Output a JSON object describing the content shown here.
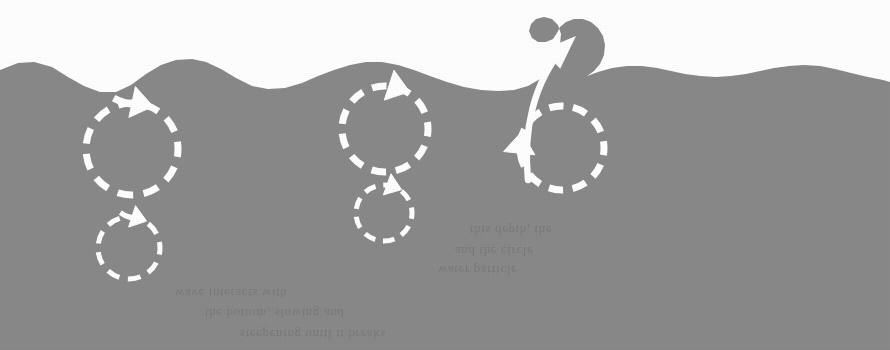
{
  "figure": {
    "title": "Wave orbital motion and breaking wave over a sloping shore"
  },
  "colors": {
    "page_background": "#ffffff",
    "water_fill": "#898989",
    "seabed_fill": "#d7d7d7",
    "annotation_stroke": "#ffffff",
    "bleed_text": "#b9b9b9"
  },
  "water": {
    "name": "water-body",
    "surface_points": "0,70 18,63 34,62 52,67 68,77 84,86 100,92 116,92 131,85 146,74 161,65 176,60 192,59 206,62 221,69 236,78 252,86 268,89 285,88 302,83 318,76 334,70 350,65 366,62 382,62 398,65 414,70 430,76 447,82 464,87 481,90 498,91 514,90 528,86 540,79 549,69 556,57 560,45 561,34 558,25 552,19 544,17 536,19 531,24 529,31 532,38 538,42 546,42 553,39 557,33 560,27 566,22 574,19 583,19 591,22 598,28 603,36 605,45 604,55 600,64 594,71 587,76 598,72 612,68 627,66 642,66 657,68 671,71 685,74 700,76 716,77 731,76 746,74 760,71 774,68 789,66 804,65 820,66 835,69 851,73 868,77 883,80 890,82",
    "crest": {
      "name": "breaking-crest",
      "x": 560,
      "y": 18,
      "label": "breaking wave crest"
    }
  },
  "seabed": {
    "name": "sloping-seabed",
    "profile_points": "0,312 60,300 125,289 195,279 265,269 330,259 400,248 470,236 540,222 610,206 680,190 750,174 820,158 890,144",
    "label": "sloping bottom"
  },
  "orbits": [
    {
      "id": "orbit-deep-large-left",
      "name": "orbit-circle-large-left",
      "cx": 132,
      "cy": 149,
      "r": 46,
      "arrow": {
        "angle_deg": -78,
        "direction": "clockwise",
        "style": "open-barbed"
      },
      "style": "dashed",
      "label": "large orbital path in deep water"
    },
    {
      "id": "orbit-deep-small-left",
      "name": "orbit-circle-small-left",
      "cx": 129,
      "cy": 248,
      "r": 31,
      "arrow": {
        "angle_deg": -72,
        "direction": "clockwise",
        "style": "open-barbed"
      },
      "style": "dashed",
      "label": "smaller orbital path with depth"
    },
    {
      "id": "orbit-mid-large",
      "name": "orbit-circle-large-middle",
      "cx": 385,
      "cy": 129,
      "r": 43,
      "arrow": {
        "angle_deg": -72,
        "direction": "clockwise",
        "style": "solid-triangle"
      },
      "style": "dashed",
      "label": "compressed orbital path in shoaling water"
    },
    {
      "id": "orbit-mid-small",
      "name": "orbit-circle-small-middle",
      "cx": 384,
      "cy": 213,
      "r": 28,
      "arrow": {
        "angle_deg": -70,
        "direction": "clockwise",
        "style": "solid-triangle"
      },
      "style": "dashed",
      "label": "flattened orbital path near bottom"
    },
    {
      "id": "orbit-breaker",
      "name": "orbit-circle-breaker",
      "cx": 562,
      "cy": 148,
      "r": 42,
      "arrow": {
        "angle_deg": 186,
        "direction": "clockwise",
        "style": "solid-triangle"
      },
      "style": "dashed",
      "label": "orbital path beneath the breaker"
    }
  ],
  "crest_arrow": {
    "name": "breaking-crest-arrow",
    "path": "M 528,180 C 523,131 533,82 565,46",
    "head_at": {
      "x": 576,
      "y": 36
    },
    "style": "solid-curved",
    "label": "water carried forward up the breaking crest"
  },
  "bleed_text": {
    "note": "faint show-through text from the reverse side of the printed page",
    "lines": [
      {
        "text": "this depth, the",
        "x": 470,
        "y": 222,
        "size": 13
      },
      {
        "text": "and the circle",
        "x": 455,
        "y": 243,
        "size": 13
      },
      {
        "text": "water particle",
        "x": 438,
        "y": 262,
        "size": 13
      },
      {
        "text": "wave interacts with",
        "x": 175,
        "y": 285,
        "size": 13
      },
      {
        "text": "the bottom, slowing and",
        "x": 205,
        "y": 305,
        "size": 13
      },
      {
        "text": "steepening until it breaks",
        "x": 240,
        "y": 326,
        "size": 13
      }
    ]
  }
}
